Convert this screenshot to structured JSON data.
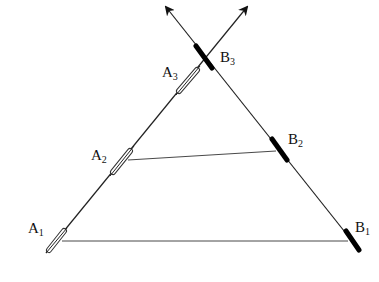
{
  "diagram": {
    "type": "geometry",
    "points": {
      "A1": {
        "label": "A",
        "sub": "1"
      },
      "A2": {
        "label": "A",
        "sub": "2"
      },
      "A3": {
        "label": "A",
        "sub": "3"
      },
      "B1": {
        "label": "B",
        "sub": "1"
      },
      "B2": {
        "label": "B",
        "sub": "2"
      },
      "B3": {
        "label": "B",
        "sub": "3"
      }
    },
    "colors": {
      "line": "#222222",
      "filled_marker": "#000000",
      "hollow_marker": "#ffffff"
    }
  }
}
